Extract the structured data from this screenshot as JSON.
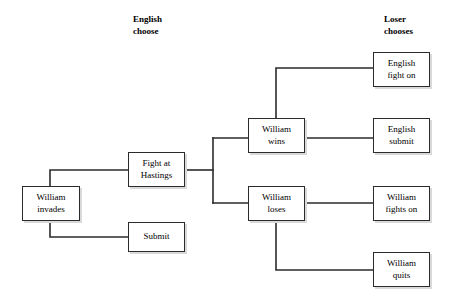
{
  "diagram": {
    "width": 457,
    "height": 299,
    "background_color": "#ffffff",
    "line_color": "#2b2b2b",
    "box_border_color": "#2b2b2b",
    "box_fill_color": "#ffffff",
    "box_shadow_color": "#d9d9d9",
    "text_color": "#000000"
  },
  "headers": [
    {
      "id": "english-choose",
      "label": "English\nchoose",
      "x": 133,
      "y": 14
    },
    {
      "id": "loser-chooses",
      "label": "Loser\nchooses",
      "x": 384,
      "y": 14
    }
  ],
  "nodes": [
    {
      "id": "william-invades",
      "label": "William\ninvades",
      "x": 22,
      "y": 186,
      "w": 58,
      "h": 35
    },
    {
      "id": "fight-at-hastings",
      "label": "Fight at\nHastings",
      "x": 128,
      "y": 152,
      "w": 57,
      "h": 35
    },
    {
      "id": "submit",
      "label": "Submit",
      "x": 128,
      "y": 222,
      "w": 57,
      "h": 30
    },
    {
      "id": "william-wins",
      "label": "William\nwins",
      "x": 248,
      "y": 118,
      "w": 57,
      "h": 35
    },
    {
      "id": "william-loses",
      "label": "William\nloses",
      "x": 248,
      "y": 186,
      "w": 57,
      "h": 35
    },
    {
      "id": "english-fight-on",
      "label": "English\nfight on",
      "x": 373,
      "y": 52,
      "w": 57,
      "h": 35
    },
    {
      "id": "english-submit",
      "label": "English\nsubmit",
      "x": 373,
      "y": 118,
      "w": 57,
      "h": 35
    },
    {
      "id": "william-fights-on",
      "label": "William\nfights on",
      "x": 373,
      "y": 186,
      "w": 57,
      "h": 35
    },
    {
      "id": "william-quits",
      "label": "William\nquits",
      "x": 373,
      "y": 252,
      "w": 57,
      "h": 35
    }
  ],
  "edges": [
    {
      "id": "invades-to-hastings",
      "from": "william-invades",
      "to": "fight-at-hastings",
      "points": "50,186 50,170 128,170"
    },
    {
      "id": "invades-to-submit",
      "from": "william-invades",
      "to": "submit",
      "points": "50,221 50,237 128,237"
    },
    {
      "id": "hastings-to-junction",
      "from": "fight-at-hastings",
      "to": "junction",
      "points": "185,170 213,170"
    },
    {
      "id": "junction-spine",
      "from": "junction",
      "to": "junction",
      "points": "213,138 213,203"
    },
    {
      "id": "junction-to-wins",
      "from": "junction",
      "to": "william-wins",
      "points": "213,138 248,138"
    },
    {
      "id": "junction-to-loses",
      "from": "junction",
      "to": "william-loses",
      "points": "213,203 248,203"
    },
    {
      "id": "wins-to-english-fight-on",
      "from": "william-wins",
      "to": "english-fight-on",
      "points": "276,118 276,68 373,68"
    },
    {
      "id": "wins-to-english-submit",
      "from": "william-wins",
      "to": "english-submit",
      "points": "305,138 373,138"
    },
    {
      "id": "loses-to-william-fights-on",
      "from": "william-loses",
      "to": "william-fights-on",
      "points": "305,203 373,203"
    },
    {
      "id": "loses-to-william-quits",
      "from": "william-loses",
      "to": "william-quits",
      "points": "276,221 276,270 373,270"
    }
  ]
}
